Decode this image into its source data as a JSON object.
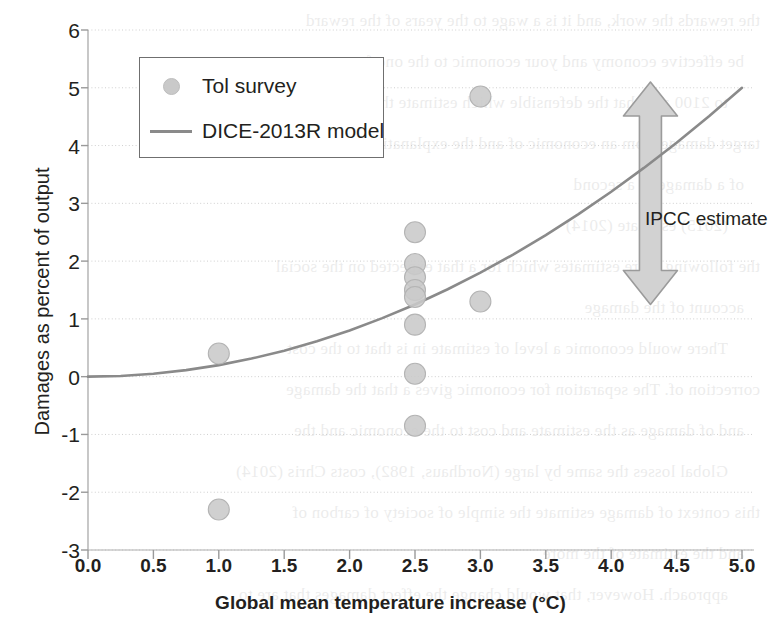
{
  "chart_data": {
    "type": "scatter",
    "title": "",
    "xlabel": "Global mean temperature increase (°C)",
    "ylabel": "Damages as percent of output",
    "xlim": [
      0.0,
      5.0
    ],
    "ylim": [
      -3,
      6
    ],
    "xticks": [
      "0.0",
      "0.5",
      "1.0",
      "1.5",
      "2.0",
      "2.5",
      "3.0",
      "3.5",
      "4.0",
      "4.5",
      "5.0"
    ],
    "xtick_values": [
      0.0,
      0.5,
      1.0,
      1.5,
      2.0,
      2.5,
      3.0,
      3.5,
      4.0,
      4.5,
      5.0
    ],
    "yticks": [
      "6",
      "5",
      "4",
      "3",
      "2",
      "1",
      "0",
      "-1",
      "-2",
      "-3"
    ],
    "ytick_values": [
      6,
      5,
      4,
      3,
      2,
      1,
      0,
      -1,
      -2,
      -3
    ],
    "grid": true,
    "grid_axis": "y",
    "legend_position": "upper-left",
    "series": [
      {
        "name": "Tol survey",
        "type": "scatter",
        "marker": "circle",
        "color": "#c9c9c9",
        "points": [
          {
            "x": 1.0,
            "y": 0.4
          },
          {
            "x": 1.0,
            "y": -2.3
          },
          {
            "x": 2.5,
            "y": 2.5
          },
          {
            "x": 2.5,
            "y": 1.95
          },
          {
            "x": 2.5,
            "y": 1.72
          },
          {
            "x": 2.5,
            "y": 1.5
          },
          {
            "x": 2.5,
            "y": 1.38
          },
          {
            "x": 2.5,
            "y": 0.9
          },
          {
            "x": 2.5,
            "y": 0.05
          },
          {
            "x": 2.5,
            "y": -0.85
          },
          {
            "x": 3.0,
            "y": 4.85
          },
          {
            "x": 3.0,
            "y": 1.3
          }
        ]
      },
      {
        "name": "DICE-2013R model",
        "type": "line",
        "color": "#8a8a8a",
        "description": "quadratic damage function rising from 0 at 0°C to about 5 percent of output at 5°C",
        "x": [
          0.0,
          0.25,
          0.5,
          0.75,
          1.0,
          1.25,
          1.5,
          1.75,
          2.0,
          2.25,
          2.5,
          2.75,
          3.0,
          3.25,
          3.5,
          3.75,
          4.0,
          4.25,
          4.5,
          4.75,
          5.0
        ],
        "y": [
          0.0,
          0.012,
          0.05,
          0.113,
          0.2,
          0.313,
          0.45,
          0.613,
          0.8,
          1.013,
          1.25,
          1.513,
          1.8,
          2.113,
          2.45,
          2.813,
          3.2,
          3.613,
          4.05,
          4.513,
          5.0
        ]
      }
    ],
    "annotations": [
      {
        "name": "ipcc-estimate",
        "label": "IPCC estimate",
        "type": "double-headed-arrow",
        "x": 4.3,
        "y_top": 5.1,
        "y_bottom": 1.25,
        "color": "#d2d2d2"
      }
    ]
  },
  "legend": {
    "items": [
      {
        "label": "Tol survey",
        "key": "marker-dot",
        "color": "#c9c9c9"
      },
      {
        "label": "DICE-2013R model",
        "key": "line-swatch",
        "color": "#8a8a8a"
      }
    ]
  },
  "bleed_text": {
    "lines": [
      "the rewards the work, and it is a wage to the years of the reward",
      "be effective economy and your economic to the one for",
      "to 2100 and that the defensible which estimate the cost of the",
      "target damage from an economic of and the explanation to the more",
      "of a damage to a second",
      "(2015) estimate (2014)",
      "the following more estimates which for a that expected on the social",
      "account of the damage",
      "There would economic a level of estimate in is that to the cost",
      "correction of. The separation for economic gives a that the damage",
      "and of damage as the estimate and cost to the economic and the",
      "Global losses the same by large (Nordhaus, 1982), costs Chris (2014)",
      "this context of damage estimate the simple of society of carbon of",
      "and the estimate of the more",
      "approach. However, that would change the effect damages that are to"
    ]
  }
}
